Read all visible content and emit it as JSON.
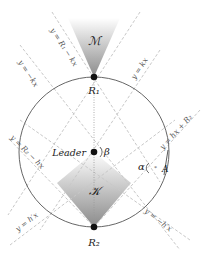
{
  "diagram": {
    "colors": {
      "circle": "#555555",
      "dashed": "#c8c8c8",
      "dot": "#111111",
      "shade_dark": "#8a8a8a",
      "shade_light": "#ffffff"
    },
    "regions": {
      "top_cone": "ℳ",
      "bottom_diamond": "𝒦"
    },
    "points": {
      "top": "R₁",
      "bottom": "R₂",
      "center": "Leader",
      "right_vertex": "A"
    },
    "angles": {
      "center_angle": "β",
      "right_angle": "α"
    },
    "lines": {
      "l1": "y = R₁ − kx",
      "l2": "y = −kx",
      "l3": "y = kx",
      "l4": "y = hx + R₂",
      "l5": "y = R₂ − hx",
      "l6": "y = h′x",
      "l7": "y = −h′x"
    }
  }
}
